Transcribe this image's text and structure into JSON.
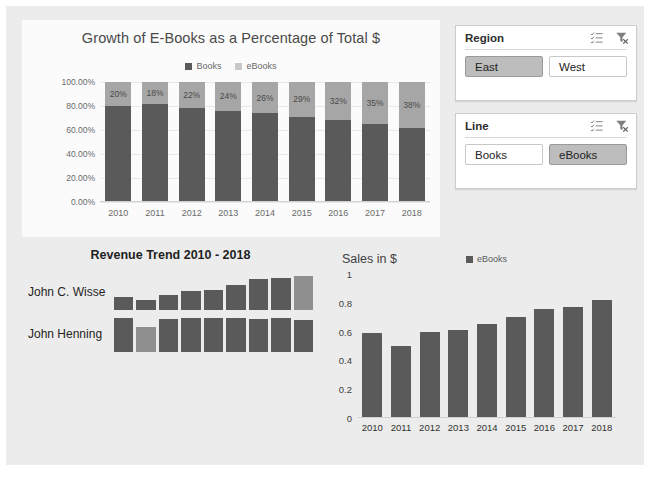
{
  "chart_data": [
    {
      "type": "bar",
      "subtype": "stacked-column-100",
      "title": "Growth of E-Books as a Percentage of Total $",
      "categories": [
        "2010",
        "2011",
        "2012",
        "2013",
        "2014",
        "2015",
        "2016",
        "2017",
        "2018"
      ],
      "series": [
        {
          "name": "Books",
          "values": [
            80,
            82,
            78,
            76,
            74,
            71,
            68,
            65,
            62
          ],
          "color": "#5a5a5a"
        },
        {
          "name": "eBooks",
          "values": [
            20,
            18,
            22,
            24,
            26,
            29,
            32,
            35,
            38
          ],
          "color": "#a6a6a6"
        }
      ],
      "data_labels": [
        "20%",
        "18%",
        "22%",
        "24%",
        "26%",
        "29%",
        "32%",
        "35%",
        "38%"
      ],
      "ytick_labels": [
        "100.00%",
        "80.00%",
        "60.00%",
        "40.00%",
        "20.00%",
        "0.00%"
      ],
      "ytick_values": [
        100,
        80,
        60,
        40,
        20,
        0
      ],
      "ylim": [
        0,
        100
      ],
      "xlabel": "",
      "ylabel": "",
      "legend": [
        "Books",
        "eBooks"
      ],
      "legend_position": "top",
      "grid": true
    },
    {
      "type": "bar",
      "subtype": "sparkline-column",
      "title": "Revenue Trend 2010 - 2018",
      "categories": [
        "2010",
        "2011",
        "2012",
        "2013",
        "2014",
        "2015",
        "2016",
        "2017",
        "2018"
      ],
      "series": [
        {
          "name": "John C. Wisse",
          "values": [
            0.38,
            0.3,
            0.43,
            0.55,
            0.58,
            0.72,
            0.88,
            0.92,
            0.97
          ],
          "highlight_index": 8,
          "color": "#5a5a5a",
          "highlight_color": "#8f8f8f"
        },
        {
          "name": "John Henning",
          "values": [
            0.95,
            0.7,
            0.93,
            0.95,
            0.95,
            0.96,
            0.94,
            0.95,
            0.9
          ],
          "highlight_index": 1,
          "color": "#5a5a5a",
          "highlight_color": "#8f8f8f"
        }
      ],
      "grid": false,
      "legend_position": "none"
    },
    {
      "type": "bar",
      "subtype": "column",
      "title": "Sales in $",
      "categories": [
        "2010",
        "2011",
        "2012",
        "2013",
        "2014",
        "2015",
        "2016",
        "2017",
        "2018"
      ],
      "series": [
        {
          "name": "eBooks",
          "values": [
            0.59,
            0.5,
            0.6,
            0.61,
            0.65,
            0.7,
            0.76,
            0.77,
            0.82
          ],
          "color": "#5a5a5a"
        }
      ],
      "ytick_labels": [
        "1",
        "0.8",
        "0.6",
        "0.4",
        "0.2",
        "0"
      ],
      "ytick_values": [
        1,
        0.8,
        0.6,
        0.4,
        0.2,
        0
      ],
      "ylim": [
        0,
        1
      ],
      "xlabel": "",
      "ylabel": "",
      "legend": [
        "eBooks"
      ],
      "legend_position": "top-right",
      "grid": false
    }
  ],
  "stacked_chart": {
    "title": "Growth of E-Books as a Percentage of Total $",
    "legend": [
      {
        "label": "Books",
        "color": "#5a5a5a"
      },
      {
        "label": "eBooks",
        "color": "#a6a6a6"
      }
    ]
  },
  "sparkline_chart": {
    "title": "Revenue Trend 2010 - 2018",
    "rows": [
      {
        "name": "John C. Wisse"
      },
      {
        "name": "John Henning"
      }
    ]
  },
  "sales_chart": {
    "title": "Sales in $",
    "legend_label": "eBooks"
  },
  "slicers": [
    {
      "title": "Region",
      "multiselect_icon": "multi-select-icon",
      "clear_filter_icon": "clear-filter-icon",
      "items": [
        {
          "label": "East",
          "selected": true
        },
        {
          "label": "West",
          "selected": false
        }
      ]
    },
    {
      "title": "Line",
      "multiselect_icon": "multi-select-icon",
      "clear_filter_icon": "clear-filter-icon",
      "items": [
        {
          "label": "Books",
          "selected": false
        },
        {
          "label": "eBooks",
          "selected": true
        }
      ]
    }
  ]
}
